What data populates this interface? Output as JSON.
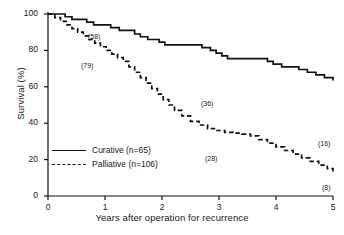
{
  "chart_data": {
    "type": "line",
    "title": "",
    "xlabel": "Years after operation for recurrence",
    "ylabel": "Survival (%)",
    "xlim": [
      0,
      5
    ],
    "ylim": [
      0,
      100
    ],
    "xticks": [
      "0",
      "1",
      "2",
      "3",
      "4",
      "5"
    ],
    "yticks": [
      "0",
      "20",
      "40",
      "60",
      "80",
      "100"
    ],
    "grid": false,
    "legend_position": "lower left",
    "series": [
      {
        "name": "Curative (n=65)",
        "style": "solid",
        "color": "#111111",
        "step": true,
        "x": [
          0.0,
          0.2,
          0.3,
          0.42,
          0.55,
          0.68,
          0.8,
          0.95,
          1.1,
          1.25,
          1.4,
          1.52,
          1.62,
          1.75,
          1.85,
          1.95,
          2.05,
          2.3,
          2.55,
          2.7,
          2.85,
          2.95,
          3.05,
          3.15,
          3.45,
          3.7,
          3.85,
          3.95,
          4.1,
          4.25,
          4.4,
          4.55,
          4.7,
          4.85,
          5.0
        ],
        "y": [
          100,
          100,
          98.5,
          97,
          97,
          95.5,
          94,
          94,
          92.5,
          91,
          91,
          89,
          87.5,
          86,
          86,
          84.5,
          83,
          83,
          83,
          81.5,
          80,
          78.5,
          77,
          75.5,
          75.5,
          75.5,
          74,
          72.5,
          71,
          71,
          69.5,
          68,
          66.5,
          65,
          63.5
        ]
      },
      {
        "name": "Palliative (n=106)",
        "style": "dashed",
        "color": "#111111",
        "step": true,
        "x": [
          0.0,
          0.12,
          0.22,
          0.32,
          0.42,
          0.52,
          0.62,
          0.72,
          0.82,
          0.92,
          1.02,
          1.12,
          1.22,
          1.32,
          1.42,
          1.52,
          1.62,
          1.72,
          1.82,
          1.92,
          2.02,
          2.12,
          2.22,
          2.35,
          2.5,
          2.65,
          2.8,
          2.95,
          3.1,
          3.25,
          3.4,
          3.55,
          3.7,
          3.85,
          4.0,
          4.15,
          4.3,
          4.45,
          4.6,
          4.75,
          4.9,
          5.0
        ],
        "y": [
          100,
          98,
          96,
          94,
          92,
          90,
          88,
          86,
          84,
          82,
          80,
          78,
          76,
          74,
          71,
          68,
          65,
          62,
          59,
          56,
          53,
          50,
          47,
          44,
          41,
          39,
          37,
          36,
          35,
          34.5,
          34,
          33,
          31,
          29,
          27,
          25,
          23,
          21,
          19,
          17,
          15,
          13
        ]
      }
    ],
    "annotations": [
      {
        "label": "(58)",
        "series": "Curative (n=65)",
        "x_px": 88,
        "y_px": 33,
        "at_risk": 58
      },
      {
        "label": "(36)",
        "series": "Curative (n=65)",
        "x_px": 201,
        "y_px": 100,
        "at_risk": 36
      },
      {
        "label": "(16)",
        "series": "Curative (n=65)",
        "x_px": 318,
        "y_px": 140,
        "at_risk": 16
      },
      {
        "label": "(79)",
        "series": "Palliative (n=106)",
        "x_px": 81,
        "y_px": 62,
        "at_risk": 79
      },
      {
        "label": "(28)",
        "series": "Palliative (n=106)",
        "x_px": 205,
        "y_px": 155,
        "at_risk": 28
      },
      {
        "label": "(8)",
        "series": "Palliative (n=106)",
        "x_px": 322,
        "y_px": 184,
        "at_risk": 8
      }
    ],
    "legend_entries": [
      {
        "label": "Curative (n=65)",
        "style": "solid"
      },
      {
        "label": "Palliative (n=106)",
        "style": "dashed"
      }
    ]
  }
}
